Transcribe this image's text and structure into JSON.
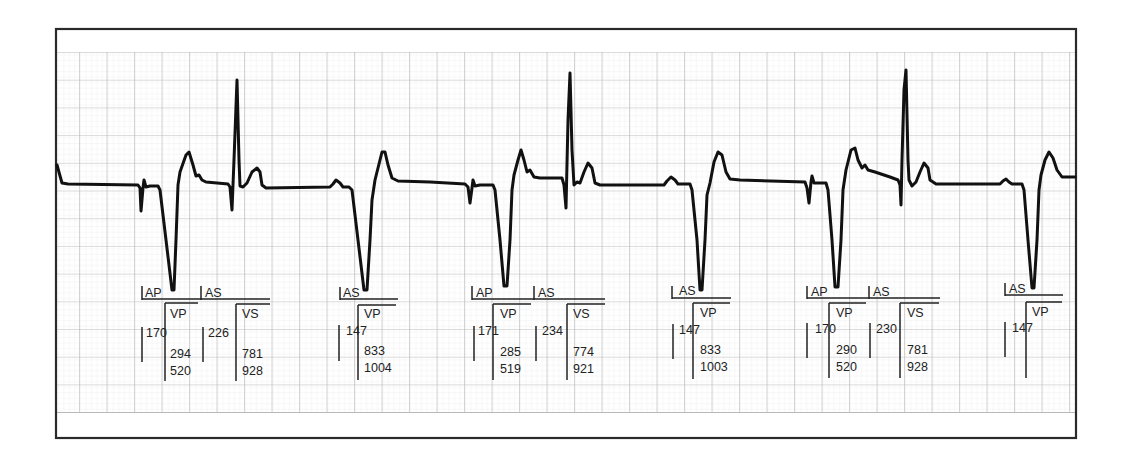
{
  "strip": {
    "type": "ECG rhythm strip with pacemaker marker channel",
    "colors": {
      "grid_major": "#b8b8b8",
      "grid_minor": "#e2e2e2",
      "trace": "#111111",
      "frame": "#2a2a2a",
      "paper": "#ffffff"
    }
  },
  "beats": [
    {
      "atrial_marker": "AP",
      "ventricular_marker": "VP",
      "av_interval": "170",
      "v_values": [
        "294",
        "520"
      ],
      "secondary": {
        "atrial_marker": "AS",
        "ventricular_marker": "VS",
        "av_interval": "226",
        "v_values": [
          "781",
          "928"
        ]
      }
    },
    {
      "atrial_marker": "AS",
      "ventricular_marker": "VP",
      "av_interval": "147",
      "v_values": [
        "833",
        "1004"
      ]
    },
    {
      "atrial_marker": "AP",
      "ventricular_marker": "VP",
      "av_interval": "171",
      "v_values": [
        "285",
        "519"
      ],
      "secondary": {
        "atrial_marker": "AS",
        "ventricular_marker": "VS",
        "av_interval": "234",
        "v_values": [
          "774",
          "921"
        ]
      }
    },
    {
      "atrial_marker": "AS",
      "ventricular_marker": "VP",
      "av_interval": "147",
      "v_values": [
        "833",
        "1003"
      ]
    },
    {
      "atrial_marker": "AP",
      "ventricular_marker": "VP",
      "av_interval": "170",
      "v_values": [
        "290",
        "520"
      ],
      "secondary": {
        "atrial_marker": "AS",
        "ventricular_marker": "VS",
        "av_interval": "230",
        "v_values": [
          "781",
          "928"
        ]
      }
    },
    {
      "atrial_marker": "AS",
      "ventricular_marker": "VP",
      "av_interval": "147",
      "v_values": []
    }
  ]
}
